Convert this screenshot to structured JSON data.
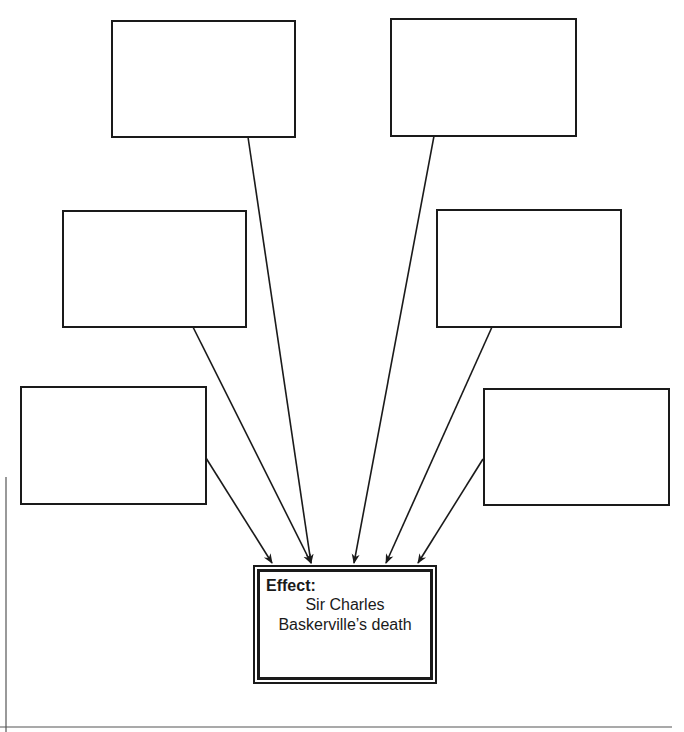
{
  "diagram": {
    "type": "cause-effect organizer",
    "effect": {
      "label": "Effect:",
      "line1": "Sir Charles",
      "line2": "Baskerville’s death"
    },
    "causes": [
      {
        "id": "cause-1",
        "position": "top-left",
        "text": ""
      },
      {
        "id": "cause-2",
        "position": "top-right",
        "text": ""
      },
      {
        "id": "cause-3",
        "position": "middle-left",
        "text": ""
      },
      {
        "id": "cause-4",
        "position": "middle-right",
        "text": ""
      },
      {
        "id": "cause-5",
        "position": "bottom-left",
        "text": ""
      },
      {
        "id": "cause-6",
        "position": "bottom-right",
        "text": ""
      }
    ],
    "colors": {
      "stroke": "#1a1a1a",
      "background": "#ffffff"
    }
  }
}
